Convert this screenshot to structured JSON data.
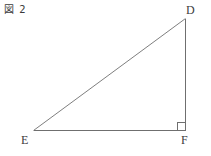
{
  "figure": {
    "caption": "図 2",
    "caption_prefix": "図",
    "caption_number": "2"
  },
  "canvas": {
    "width": 211,
    "height": 156,
    "background": "#ffffff"
  },
  "diagram": {
    "type": "right-triangle",
    "stroke_color": "#6f6f6f",
    "stroke_width": 1,
    "vertices": [
      {
        "name": "D",
        "label": "D",
        "x": 185,
        "y": 18
      },
      {
        "name": "E",
        "label": "E",
        "x": 33,
        "y": 131
      },
      {
        "name": "F",
        "label": "F",
        "x": 185,
        "y": 131
      }
    ],
    "edges": [
      {
        "name": "hypotenuse-ED",
        "from": "E",
        "to": "D"
      },
      {
        "name": "base-EF",
        "from": "E",
        "to": "F"
      },
      {
        "name": "vertical-DF",
        "from": "D",
        "to": "F"
      }
    ],
    "right_angle": {
      "at_vertex": "F",
      "marker": "square",
      "size": 8,
      "x": 177,
      "y": 123
    }
  }
}
